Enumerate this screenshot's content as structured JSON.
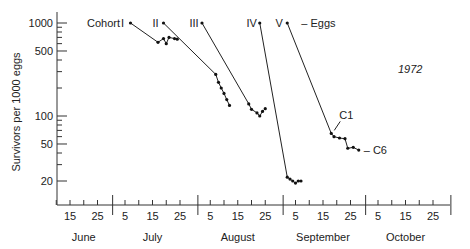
{
  "chart_data": {
    "type": "line",
    "title": "",
    "year_label": "1972",
    "ylabel": "Survivors per 1000 eggs",
    "xlabel": "",
    "yscale": "log",
    "ylim": [
      13,
      1200
    ],
    "y_ticks_labeled": [
      1000,
      500,
      100,
      50,
      20
    ],
    "y_ticks_minor": [
      900,
      800,
      700,
      600,
      400,
      300,
      200,
      90,
      80,
      70,
      60,
      40,
      30
    ],
    "months": [
      {
        "name": "June",
        "ticks": [
          "15",
          "25"
        ]
      },
      {
        "name": "July",
        "ticks": [
          "5",
          "15",
          "25"
        ]
      },
      {
        "name": "August",
        "ticks": [
          "5",
          "15",
          "25"
        ]
      },
      {
        "name": "September",
        "ticks": [
          "5",
          "15",
          "25"
        ]
      },
      {
        "name": "October",
        "ticks": [
          "5",
          "15",
          "25"
        ]
      }
    ],
    "x_day_range": [
      "June 10",
      "October 31"
    ],
    "annotations": {
      "cohort_label": "Cohort",
      "eggs_label": "– Eggs",
      "c1_label": "C1",
      "c6_label": "– C6"
    },
    "series": [
      {
        "name": "I",
        "points": [
          [
            37,
            1000
          ],
          [
            47,
            620
          ],
          [
            49,
            680
          ],
          [
            50,
            600
          ],
          [
            51,
            700
          ],
          [
            53,
            680
          ],
          [
            54,
            670
          ]
        ]
      },
      {
        "name": "II",
        "points": [
          [
            49,
            1000
          ],
          [
            68,
            280
          ],
          [
            69,
            230
          ],
          [
            70,
            200
          ],
          [
            71,
            175
          ],
          [
            72,
            150
          ],
          [
            73,
            130
          ]
        ]
      },
      {
        "name": "III",
        "points": [
          [
            63,
            1000
          ],
          [
            80,
            135
          ],
          [
            81,
            118
          ],
          [
            83,
            108
          ],
          [
            84,
            100
          ],
          [
            85,
            112
          ],
          [
            86,
            120
          ]
        ]
      },
      {
        "name": "IV",
        "points": [
          [
            84,
            1000
          ],
          [
            94,
            22
          ],
          [
            95,
            21
          ],
          [
            96,
            20
          ],
          [
            97,
            19
          ],
          [
            98,
            20
          ],
          [
            99,
            20
          ]
        ]
      },
      {
        "name": "V",
        "points": [
          [
            94,
            1000
          ],
          [
            110,
            65
          ],
          [
            111,
            60
          ],
          [
            113,
            58
          ],
          [
            115,
            57
          ],
          [
            116,
            45
          ],
          [
            118,
            46
          ],
          [
            120,
            43
          ]
        ]
      }
    ]
  }
}
